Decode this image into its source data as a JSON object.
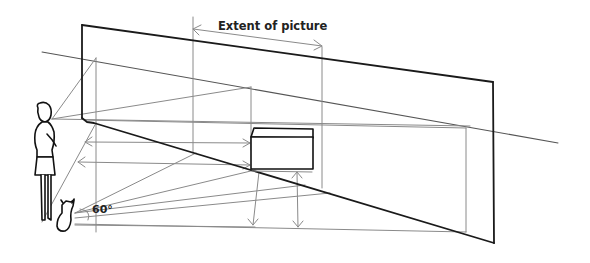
{
  "diagram": {
    "labels": {
      "extent": "Extent of picture",
      "angle": "60°"
    },
    "colors": {
      "background": "#ffffff",
      "wall_outline": "#1a1a1a",
      "construction_lines": "#8a8a8a",
      "text": "#222222"
    },
    "elements": [
      "observer-woman",
      "dog",
      "picture-plane-wall",
      "horizon-line",
      "box-object",
      "projection-lines",
      "extent-arrow",
      "angle-arc"
    ]
  }
}
